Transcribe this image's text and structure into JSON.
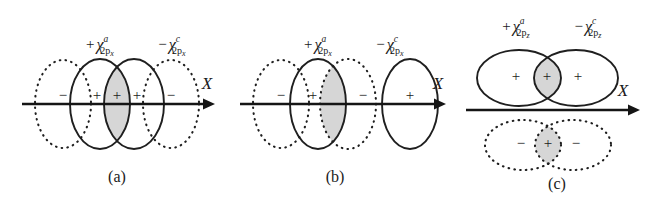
{
  "figure": {
    "background_color": "#ffffff",
    "stroke_color": "#1f1f1f",
    "overlap_fill_color": "#cfcfcf",
    "panels": [
      {
        "id": "a",
        "caption": "(a)",
        "axis_label": "X",
        "orbital_labels": [
          {
            "sign": "+",
            "symbol": "χ",
            "superscript": "a",
            "sub_n": "2",
            "sub_orbital": "p",
            "sub_axis": "x",
            "full_text": "+χ²ᵖˣ (a)"
          },
          {
            "sign": "−",
            "symbol": "χ",
            "superscript": "c",
            "sub_n": "2",
            "sub_orbital": "p",
            "sub_axis": "x",
            "full_text": "−χ²ᵖˣ (c)"
          }
        ],
        "lobes": [
          {
            "style": "dotted",
            "sign": "−",
            "orientation": "vertical"
          },
          {
            "style": "solid",
            "sign": "+",
            "orientation": "vertical"
          },
          {
            "style": "solid",
            "sign": "+",
            "orientation": "vertical"
          },
          {
            "style": "dotted",
            "sign": "−",
            "orientation": "vertical"
          }
        ],
        "overlap": {
          "sign": "+",
          "shaded": "true",
          "between": "solid-solid"
        }
      },
      {
        "id": "b",
        "caption": "(b)",
        "axis_label": "X",
        "orbital_labels": [
          {
            "sign": "+",
            "symbol": "χ",
            "superscript": "a",
            "sub_n": "2",
            "sub_orbital": "p",
            "sub_axis": "x",
            "full_text": "+χ²ᵖˣ (a)"
          },
          {
            "sign": "−",
            "symbol": "χ",
            "superscript": "c",
            "sub_n": "2",
            "sub_orbital": "p",
            "sub_axis": "x",
            "full_text": "−χ²ᵖˣ (c)"
          }
        ],
        "lobes": [
          {
            "style": "dotted",
            "sign": "−",
            "orientation": "vertical"
          },
          {
            "style": "solid",
            "sign": "+",
            "orientation": "vertical"
          },
          {
            "style": "dotted",
            "sign": "−",
            "orientation": "vertical"
          },
          {
            "style": "solid",
            "sign": "+",
            "orientation": "vertical"
          }
        ],
        "overlap": {
          "sign": "",
          "shaded": "true",
          "between": "solid-dotted"
        }
      },
      {
        "id": "c",
        "caption": "(c)",
        "axis_label": "X",
        "axis_label_left": "X",
        "orbital_labels": [
          {
            "sign": "+",
            "symbol": "χ",
            "superscript": "a",
            "sub_n": "2",
            "sub_orbital": "p",
            "sub_axis": "z",
            "full_text": "+χ²ᵖᶻ (a)"
          },
          {
            "sign": "−",
            "symbol": "χ",
            "superscript": "c",
            "sub_n": "2",
            "sub_orbital": "p",
            "sub_axis": "z",
            "full_text": "−χ²ᵖᶻ (c)"
          }
        ],
        "upper_row": {
          "style": "solid",
          "lobes": [
            {
              "sign": "+",
              "orientation": "horizontal"
            },
            {
              "sign": "+",
              "orientation": "horizontal"
            }
          ],
          "overlap": {
            "sign": "+",
            "shaded": "true"
          }
        },
        "lower_row": {
          "style": "dotted",
          "lobes": [
            {
              "sign": "−",
              "orientation": "horizontal"
            },
            {
              "sign": "−",
              "orientation": "horizontal"
            }
          ],
          "overlap": {
            "sign": "+",
            "shaded": "true"
          }
        }
      }
    ]
  }
}
